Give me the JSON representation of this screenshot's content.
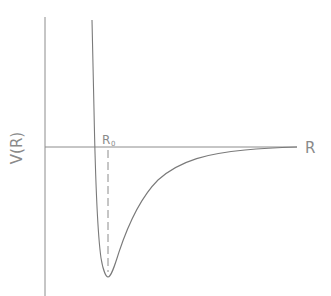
{
  "diagram": {
    "type": "potential-energy-curve",
    "y_axis_label": "V(R)",
    "x_axis_label": "R",
    "equilibrium_label": "R",
    "equilibrium_subscript": "0",
    "colors": {
      "line": "#7a7a7a",
      "text": "#8a8a8a",
      "background": "#ffffff"
    }
  }
}
